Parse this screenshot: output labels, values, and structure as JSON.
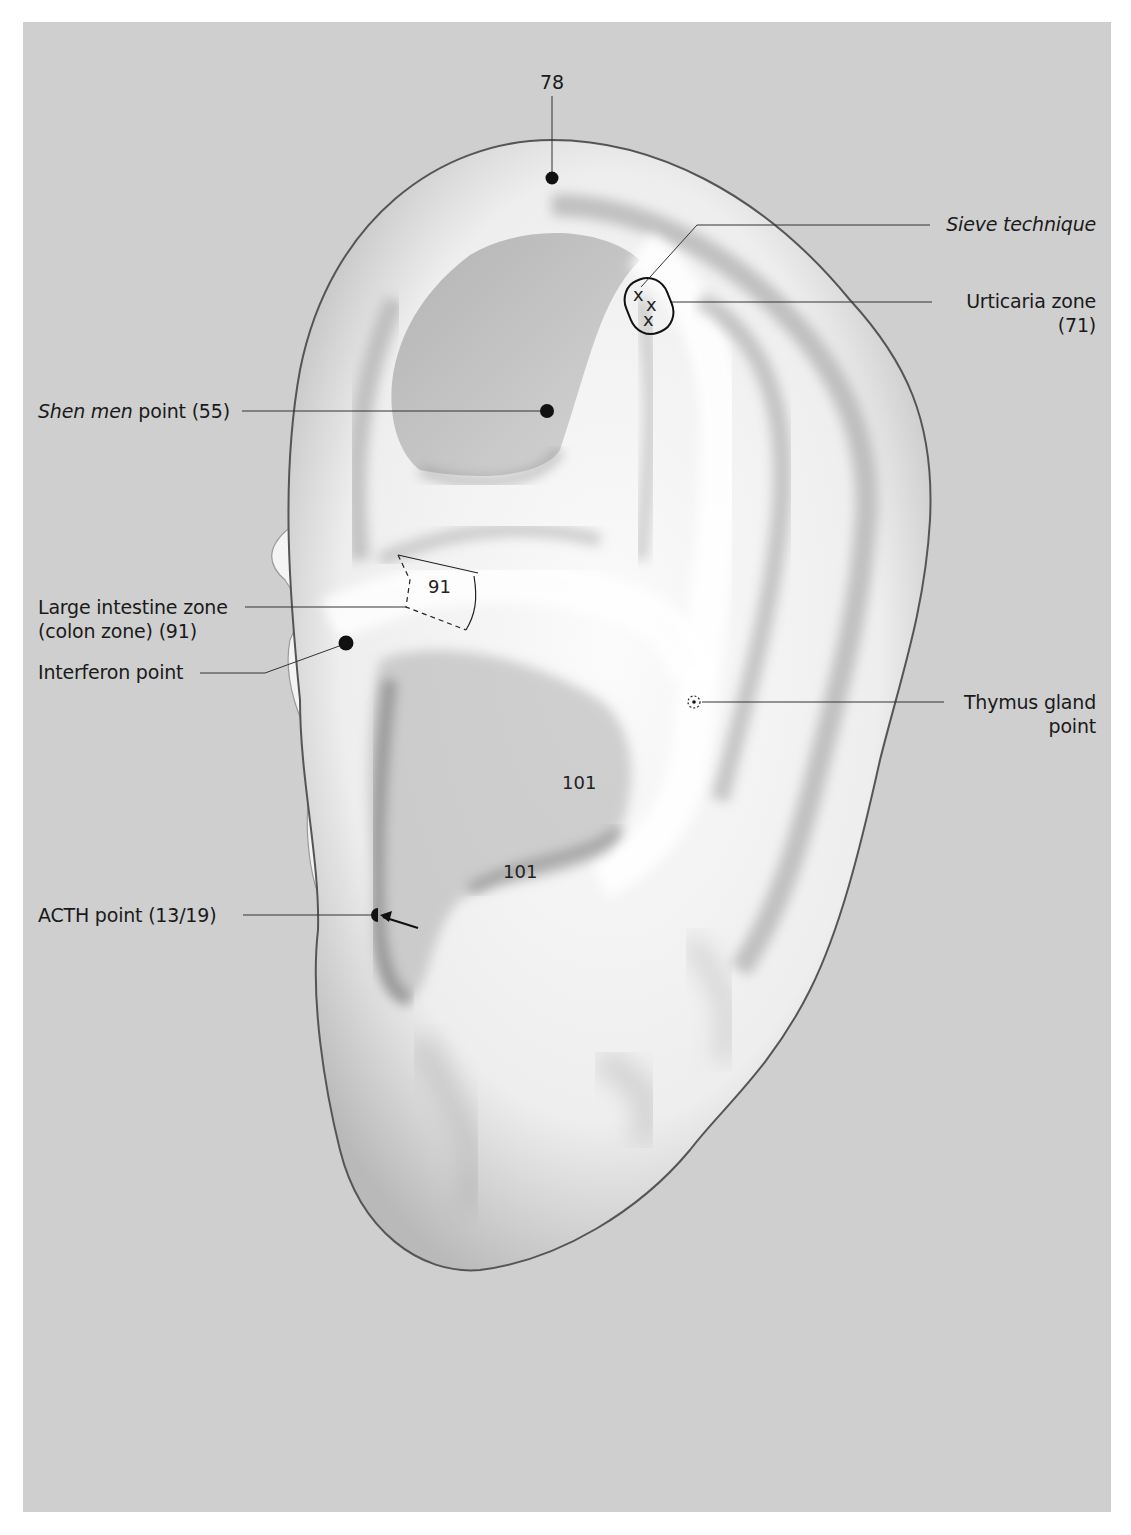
{
  "figure": {
    "background_color": "#cfcfcf",
    "marker_color": "#111111"
  },
  "labels": {
    "top_number": "78",
    "sieve": "Sieve technique",
    "urticaria_line1": "Urticaria zone",
    "urticaria_line2": "(71)",
    "shen_men_italic": "Shen men",
    "shen_men_rest": " point (55)",
    "large_intestine_line1": "Large intestine zone",
    "large_intestine_line2": "(colon zone) (91)",
    "interferon": "Interferon point",
    "thymus_line1": "Thymus gland",
    "thymus_line2": "point",
    "acth": "ACTH point (13/19)"
  },
  "region_numbers": {
    "zone_91": "91",
    "concha_upper": "101",
    "concha_lower": "101"
  },
  "points": [
    {
      "id": "point-78",
      "x": 552,
      "y": 178,
      "type": "dot"
    },
    {
      "id": "shen-men-55",
      "x": 547,
      "y": 411,
      "type": "dot"
    },
    {
      "id": "interferon",
      "x": 346,
      "y": 643,
      "type": "dot"
    },
    {
      "id": "thymus",
      "x": 694,
      "y": 702,
      "type": "dotted-circle"
    },
    {
      "id": "acth",
      "x": 376,
      "y": 915,
      "type": "half-dot-with-arrow"
    },
    {
      "id": "urticaria-71",
      "x": 650,
      "y": 303,
      "type": "oval-with-x-marks"
    }
  ]
}
